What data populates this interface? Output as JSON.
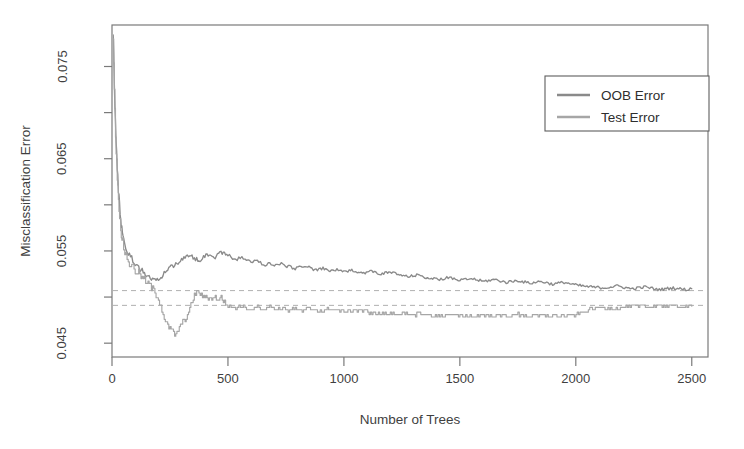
{
  "chart_data": {
    "type": "line",
    "title": "",
    "xlabel": "Number of Trees",
    "ylabel": "Misclassification Error",
    "xlim": [
      0,
      2570
    ],
    "ylim": [
      0.0435,
      0.0795
    ],
    "xticks": [
      0,
      500,
      1000,
      1500,
      2000,
      2500
    ],
    "xtick_labels": [
      "0",
      "500",
      "1000",
      "1500",
      "2000",
      "2500"
    ],
    "yticks": [
      0.045,
      0.055,
      0.065,
      0.075
    ],
    "ytick_labels": [
      "0.045",
      "0.055",
      "0.065",
      "0.075"
    ],
    "yminor_ticks": [
      0.05,
      0.06,
      0.07
    ],
    "grid": false,
    "legend_position": "top-right",
    "reference_lines": [
      {
        "name": "oob-converged-level",
        "y": 0.0507,
        "style": "dashed",
        "color": "#b0b0b0"
      },
      {
        "name": "test-converged-level",
        "y": 0.0491,
        "style": "dashed",
        "color": "#b0b0b0"
      }
    ],
    "series": [
      {
        "name": "OOB Error",
        "color": "#8a8a8a",
        "x": [
          5,
          10,
          15,
          20,
          25,
          30,
          35,
          40,
          45,
          50,
          60,
          70,
          80,
          90,
          100,
          110,
          120,
          130,
          140,
          150,
          160,
          170,
          180,
          190,
          200,
          215,
          230,
          245,
          260,
          275,
          290,
          305,
          320,
          335,
          350,
          365,
          380,
          395,
          410,
          425,
          440,
          455,
          470,
          485,
          500,
          520,
          540,
          560,
          580,
          600,
          620,
          640,
          660,
          680,
          700,
          730,
          760,
          790,
          820,
          850,
          880,
          910,
          940,
          970,
          1000,
          1040,
          1080,
          1120,
          1160,
          1200,
          1240,
          1280,
          1320,
          1360,
          1400,
          1450,
          1500,
          1550,
          1600,
          1650,
          1700,
          1750,
          1800,
          1850,
          1900,
          1950,
          2000,
          2060,
          2120,
          2180,
          2240,
          2300,
          2360,
          2420,
          2480,
          2500
        ],
        "values": [
          0.079,
          0.0732,
          0.0688,
          0.0654,
          0.0628,
          0.0608,
          0.0592,
          0.058,
          0.057,
          0.0563,
          0.0554,
          0.0548,
          0.0543,
          0.054,
          0.0537,
          0.0534,
          0.0531,
          0.0528,
          0.0526,
          0.0524,
          0.0522,
          0.052,
          0.0519,
          0.0518,
          0.0517,
          0.0523,
          0.0528,
          0.0531,
          0.0534,
          0.0536,
          0.0539,
          0.0541,
          0.0543,
          0.0545,
          0.0543,
          0.0541,
          0.054,
          0.0544,
          0.0547,
          0.0545,
          0.0542,
          0.0546,
          0.0549,
          0.0547,
          0.0545,
          0.0543,
          0.0541,
          0.0543,
          0.054,
          0.0538,
          0.054,
          0.0537,
          0.0535,
          0.0537,
          0.0534,
          0.0536,
          0.0533,
          0.0531,
          0.0534,
          0.0532,
          0.0529,
          0.0531,
          0.0528,
          0.053,
          0.0527,
          0.0529,
          0.0526,
          0.0528,
          0.0525,
          0.0527,
          0.0524,
          0.0522,
          0.0524,
          0.0521,
          0.0519,
          0.0521,
          0.0518,
          0.052,
          0.0517,
          0.0519,
          0.0516,
          0.0518,
          0.0515,
          0.0517,
          0.0514,
          0.0516,
          0.0513,
          0.0511,
          0.051,
          0.0512,
          0.0509,
          0.0511,
          0.0508,
          0.051,
          0.0508,
          0.0509
        ]
      },
      {
        "name": "Test Error",
        "color": "#a6a6a6",
        "x": [
          5,
          10,
          15,
          20,
          25,
          30,
          35,
          40,
          45,
          50,
          60,
          70,
          80,
          90,
          100,
          110,
          120,
          130,
          140,
          150,
          160,
          170,
          180,
          190,
          200,
          215,
          230,
          245,
          260,
          275,
          290,
          305,
          320,
          335,
          350,
          365,
          380,
          395,
          410,
          425,
          440,
          455,
          470,
          485,
          500,
          520,
          540,
          560,
          580,
          600,
          620,
          640,
          660,
          680,
          700,
          730,
          760,
          790,
          820,
          850,
          880,
          910,
          940,
          970,
          1000,
          1040,
          1080,
          1120,
          1160,
          1200,
          1240,
          1280,
          1320,
          1360,
          1400,
          1450,
          1500,
          1550,
          1600,
          1650,
          1700,
          1750,
          1800,
          1850,
          1900,
          1950,
          2000,
          2060,
          2120,
          2180,
          2240,
          2300,
          2360,
          2420,
          2480,
          2500
        ],
        "values": [
          0.0785,
          0.0726,
          0.0679,
          0.0645,
          0.0618,
          0.0598,
          0.0583,
          0.057,
          0.0561,
          0.0554,
          0.0545,
          0.0539,
          0.0535,
          0.0532,
          0.0529,
          0.0527,
          0.0524,
          0.0521,
          0.0518,
          0.0516,
          0.0513,
          0.051,
          0.0507,
          0.0503,
          0.0499,
          0.0486,
          0.0473,
          0.0466,
          0.0462,
          0.0459,
          0.0467,
          0.0474,
          0.0478,
          0.0486,
          0.0499,
          0.0507,
          0.0503,
          0.0499,
          0.0499,
          0.0499,
          0.0499,
          0.0499,
          0.0499,
          0.0494,
          0.049,
          0.049,
          0.0488,
          0.049,
          0.0488,
          0.0487,
          0.049,
          0.0488,
          0.0487,
          0.049,
          0.0487,
          0.0488,
          0.0486,
          0.0487,
          0.0485,
          0.0487,
          0.0486,
          0.0485,
          0.0487,
          0.0486,
          0.0484,
          0.0486,
          0.0485,
          0.0483,
          0.0481,
          0.0483,
          0.0482,
          0.048,
          0.0482,
          0.0481,
          0.0479,
          0.0481,
          0.048,
          0.0479,
          0.0481,
          0.048,
          0.0479,
          0.0481,
          0.048,
          0.0479,
          0.048,
          0.0479,
          0.0481,
          0.0487,
          0.0489,
          0.0488,
          0.049,
          0.0489,
          0.0491,
          0.049,
          0.0489,
          0.049
        ]
      }
    ],
    "legend": [
      {
        "label": "OOB Error",
        "color": "#8a8a8a"
      },
      {
        "label": "Test Error",
        "color": "#a6a6a6"
      }
    ]
  },
  "figure": {
    "background": "#ffffff",
    "axis_color": "#7a7a7a"
  }
}
